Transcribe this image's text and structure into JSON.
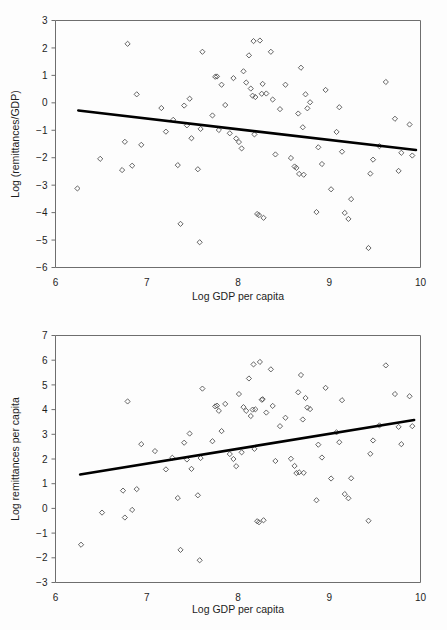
{
  "figure": {
    "background_color": "#fdfdfd",
    "marker_color": "#4a4a4a",
    "trend_color": "#000000",
    "axis_color": "#6e6e6e"
  },
  "chart_data": [
    {
      "id": "remittances-over-gdp",
      "type": "scatter",
      "title": "",
      "xlabel": "Log GDP per capita",
      "ylabel": "Log (remittances/GDP)",
      "xlim": [
        6,
        10
      ],
      "ylim": [
        -6,
        3
      ],
      "xticks": [
        6,
        7,
        8,
        9,
        10
      ],
      "yticks": [
        3,
        2,
        1,
        0,
        -1,
        -2,
        -3,
        -4,
        -5,
        -6
      ],
      "xtick_labels": [
        "6",
        "7",
        "8",
        "9",
        "10"
      ],
      "ytick_labels": [
        "3",
        "2",
        "1",
        "0",
        "−1",
        "−2",
        "−3",
        "−4",
        "−5",
        "−6"
      ],
      "grid": false,
      "legend": null,
      "marker": "open-diamond",
      "trendline": {
        "type": "linear",
        "x": [
          6.25,
          9.95
        ],
        "y": [
          -0.28,
          -1.72
        ],
        "slope": -0.389,
        "intercept": 2.151
      },
      "points": [
        [
          6.24,
          -3.12
        ],
        [
          6.49,
          -2.04
        ],
        [
          6.73,
          -2.45
        ],
        [
          6.76,
          -1.42
        ],
        [
          6.79,
          2.15
        ],
        [
          6.84,
          -2.29
        ],
        [
          6.89,
          0.31
        ],
        [
          6.94,
          -1.53
        ],
        [
          7.16,
          -0.19
        ],
        [
          7.21,
          -1.05
        ],
        [
          7.29,
          -0.62
        ],
        [
          7.34,
          -2.27
        ],
        [
          7.37,
          -4.41
        ],
        [
          7.41,
          -0.1
        ],
        [
          7.44,
          -0.82
        ],
        [
          7.47,
          0.15
        ],
        [
          7.49,
          -1.29
        ],
        [
          7.56,
          -2.42
        ],
        [
          7.58,
          -5.08
        ],
        [
          7.59,
          -0.95
        ],
        [
          7.61,
          1.86
        ],
        [
          7.72,
          -0.46
        ],
        [
          7.75,
          0.95
        ],
        [
          7.77,
          0.96
        ],
        [
          7.79,
          -0.99
        ],
        [
          7.82,
          0.66
        ],
        [
          7.86,
          -0.08
        ],
        [
          7.91,
          -1.11
        ],
        [
          7.95,
          0.9
        ],
        [
          7.98,
          -1.3
        ],
        [
          8.01,
          -1.43
        ],
        [
          8.04,
          -1.66
        ],
        [
          8.06,
          1.15
        ],
        [
          8.09,
          0.74
        ],
        [
          8.12,
          1.73
        ],
        [
          8.14,
          0.52
        ],
        [
          8.16,
          0.26
        ],
        [
          8.17,
          2.25
        ],
        [
          8.18,
          -1.15
        ],
        [
          8.19,
          0.21
        ],
        [
          8.21,
          -4.05
        ],
        [
          8.23,
          -4.09
        ],
        [
          8.24,
          2.27
        ],
        [
          8.26,
          0.33
        ],
        [
          8.27,
          0.69
        ],
        [
          8.28,
          -4.19
        ],
        [
          8.31,
          0.34
        ],
        [
          8.36,
          1.86
        ],
        [
          8.38,
          0.12
        ],
        [
          8.41,
          -1.88
        ],
        [
          8.46,
          -0.23
        ],
        [
          8.52,
          0.66
        ],
        [
          8.58,
          -2.01
        ],
        [
          8.62,
          -2.32
        ],
        [
          8.64,
          -2.37
        ],
        [
          8.66,
          -0.39
        ],
        [
          8.67,
          -2.59
        ],
        [
          8.69,
          1.28
        ],
        [
          8.71,
          -0.89
        ],
        [
          8.72,
          -2.62
        ],
        [
          8.74,
          0.31
        ],
        [
          8.76,
          -0.2
        ],
        [
          8.79,
          0.02
        ],
        [
          8.86,
          -3.98
        ],
        [
          8.88,
          -1.62
        ],
        [
          8.92,
          -2.23
        ],
        [
          8.96,
          0.47
        ],
        [
          9.02,
          -3.15
        ],
        [
          9.08,
          -1.06
        ],
        [
          9.11,
          -0.16
        ],
        [
          9.14,
          -1.78
        ],
        [
          9.17,
          -4.01
        ],
        [
          9.21,
          -4.23
        ],
        [
          9.24,
          -3.51
        ],
        [
          9.43,
          -5.29
        ],
        [
          9.45,
          -2.58
        ],
        [
          9.48,
          -2.07
        ],
        [
          9.55,
          -1.58
        ],
        [
          9.62,
          0.76
        ],
        [
          9.72,
          -0.58
        ],
        [
          9.76,
          -2.48
        ],
        [
          9.79,
          -1.82
        ],
        [
          9.88,
          -0.79
        ],
        [
          9.91,
          -1.92
        ]
      ]
    },
    {
      "id": "remittances-per-capita",
      "type": "scatter",
      "title": "",
      "xlabel": "Log GDP per capita",
      "ylabel": "Log remittances per capita",
      "xlim": [
        6,
        10
      ],
      "ylim": [
        -3,
        7
      ],
      "xticks": [
        6,
        7,
        8,
        9,
        10
      ],
      "yticks": [
        7,
        6,
        5,
        4,
        3,
        2,
        1,
        0,
        -1,
        -2,
        -3
      ],
      "xtick_labels": [
        "6",
        "7",
        "8",
        "9",
        "10"
      ],
      "ytick_labels": [
        "7",
        "6",
        "5",
        "4",
        "3",
        "2",
        "1",
        "0",
        "−1",
        "−2",
        "−3"
      ],
      "grid": false,
      "legend": null,
      "marker": "open-diamond",
      "trendline": {
        "type": "linear",
        "x": [
          6.27,
          9.93
        ],
        "y": [
          1.37,
          3.58
        ],
        "slope": 0.604,
        "intercept": -2.418
      },
      "points": [
        [
          6.28,
          -1.47
        ],
        [
          6.51,
          -0.17
        ],
        [
          6.74,
          0.72
        ],
        [
          6.76,
          -0.37
        ],
        [
          6.79,
          4.33
        ],
        [
          6.84,
          -0.06
        ],
        [
          6.89,
          0.78
        ],
        [
          6.94,
          2.6
        ],
        [
          7.09,
          2.32
        ],
        [
          7.21,
          1.58
        ],
        [
          7.28,
          2.05
        ],
        [
          7.34,
          0.42
        ],
        [
          7.37,
          -1.68
        ],
        [
          7.41,
          2.66
        ],
        [
          7.44,
          1.98
        ],
        [
          7.47,
          3.03
        ],
        [
          7.49,
          1.6
        ],
        [
          7.56,
          0.53
        ],
        [
          7.58,
          -2.1
        ],
        [
          7.59,
          2.04
        ],
        [
          7.61,
          4.85
        ],
        [
          7.72,
          2.72
        ],
        [
          7.75,
          4.13
        ],
        [
          7.77,
          4.16
        ],
        [
          7.79,
          3.95
        ],
        [
          7.82,
          3.13
        ],
        [
          7.86,
          4.23
        ],
        [
          7.91,
          2.2
        ],
        [
          7.95,
          2.0
        ],
        [
          7.98,
          1.71
        ],
        [
          8.01,
          4.63
        ],
        [
          8.04,
          2.27
        ],
        [
          8.06,
          4.1
        ],
        [
          8.09,
          3.95
        ],
        [
          8.12,
          5.26
        ],
        [
          8.14,
          3.74
        ],
        [
          8.16,
          4.0
        ],
        [
          8.17,
          5.83
        ],
        [
          8.18,
          2.41
        ],
        [
          8.19,
          4.01
        ],
        [
          8.21,
          -0.52
        ],
        [
          8.23,
          -0.56
        ],
        [
          8.24,
          5.93
        ],
        [
          8.26,
          4.4
        ],
        [
          8.27,
          4.42
        ],
        [
          8.28,
          -0.48
        ],
        [
          8.31,
          3.88
        ],
        [
          8.36,
          5.63
        ],
        [
          8.38,
          4.15
        ],
        [
          8.41,
          1.92
        ],
        [
          8.46,
          3.33
        ],
        [
          8.52,
          3.67
        ],
        [
          8.58,
          2.01
        ],
        [
          8.62,
          1.72
        ],
        [
          8.64,
          1.43
        ],
        [
          8.66,
          4.7
        ],
        [
          8.67,
          1.46
        ],
        [
          8.69,
          5.4
        ],
        [
          8.71,
          3.6
        ],
        [
          8.72,
          1.44
        ],
        [
          8.74,
          4.47
        ],
        [
          8.76,
          4.08
        ],
        [
          8.79,
          4.02
        ],
        [
          8.86,
          0.33
        ],
        [
          8.88,
          2.58
        ],
        [
          8.92,
          2.06
        ],
        [
          8.96,
          4.88
        ],
        [
          9.02,
          1.21
        ],
        [
          9.08,
          3.08
        ],
        [
          9.11,
          2.68
        ],
        [
          9.14,
          4.38
        ],
        [
          9.17,
          0.58
        ],
        [
          9.21,
          0.41
        ],
        [
          9.24,
          1.22
        ],
        [
          9.43,
          -0.5
        ],
        [
          9.45,
          2.21
        ],
        [
          9.48,
          2.75
        ],
        [
          9.55,
          3.36
        ],
        [
          9.62,
          5.79
        ],
        [
          9.72,
          4.63
        ],
        [
          9.76,
          3.3
        ],
        [
          9.79,
          2.6
        ],
        [
          9.88,
          4.54
        ],
        [
          9.91,
          3.33
        ]
      ]
    }
  ]
}
